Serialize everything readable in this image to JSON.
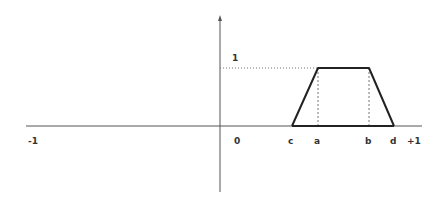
{
  "diagram": {
    "axis_labels": {
      "x_min": "-1",
      "origin": "0",
      "x_max": "+1",
      "y_one": "1"
    },
    "point_labels": {
      "c": "c",
      "a": "a",
      "b": "b",
      "d": "d"
    },
    "colors": {
      "axis": "#555555",
      "shape": "#222222",
      "guide": "#777777"
    }
  }
}
